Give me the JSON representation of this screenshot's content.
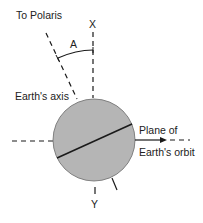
{
  "labels": {
    "polaris": "To Polaris",
    "x": "X",
    "angle": "A",
    "axis": "Earth's axis",
    "plane_line1": "Plane of",
    "plane_line2": "Earth's orbit",
    "y": "Y"
  },
  "colors": {
    "earth_fill": "#b5b5b5",
    "line": "#1a1a1a",
    "text": "#222222"
  }
}
